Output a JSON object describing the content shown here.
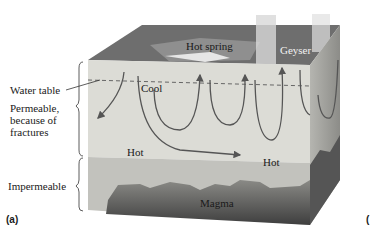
{
  "diagram": {
    "panel_label": "(a)",
    "cut_off_label": "(",
    "left_labels": {
      "water_table": "Water table",
      "permeable": [
        "Permeable,",
        "because of",
        "fractures"
      ],
      "impermeable": "Impermeable"
    },
    "surface_labels": {
      "hot_spring": "Hot spring",
      "geyser": "Geyser"
    },
    "inner_labels": {
      "cool": "Cool",
      "hot_left": "Hot",
      "hot_right": "Hot",
      "magma": "Magma"
    },
    "colors": {
      "surface": "#6a6a6a",
      "permeable": "#dcdcd6",
      "impermeable": "#bdbdb8",
      "magma": "#4a4a4a",
      "arrows": "#555555"
    }
  }
}
